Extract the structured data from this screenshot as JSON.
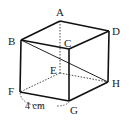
{
  "figure": {
    "type": "cube",
    "vertices": {
      "A": {
        "label": "A",
        "x": 60,
        "y": 21
      },
      "B": {
        "label": "B",
        "x": 21,
        "y": 40
      },
      "C": {
        "label": "C",
        "x": 69,
        "y": 49
      },
      "D": {
        "label": "D",
        "x": 109,
        "y": 31
      },
      "E": {
        "label": "E",
        "x": 60,
        "y": 73
      },
      "F": {
        "label": "F",
        "x": 20,
        "y": 92
      },
      "G": {
        "label": "G",
        "x": 69,
        "y": 101
      },
      "H": {
        "label": "H",
        "x": 108,
        "y": 82
      }
    },
    "visible_edges": [
      "AB",
      "AD",
      "BC",
      "CD",
      "BF",
      "CG",
      "DH",
      "FG",
      "GH"
    ],
    "hidden_edges": [
      "AE",
      "EF",
      "EH"
    ],
    "diagonal": "BH",
    "dimension": {
      "label": "4 cm",
      "edge": "FG"
    }
  }
}
